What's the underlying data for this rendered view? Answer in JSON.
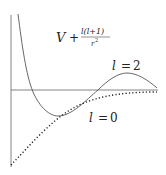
{
  "diagram": {
    "title_formula": {
      "lhs": "V",
      "plus": "+",
      "numerator": "l(l+1)",
      "denominator": "r",
      "denominator_exp": "2"
    },
    "curves": [
      {
        "name": "l = 2",
        "style": "solid",
        "label_var": "l",
        "label_eq": "=",
        "label_val": "2"
      },
      {
        "name": "l = 0",
        "style": "dotted",
        "label_var": "l",
        "label_eq": "=",
        "label_val": "0"
      }
    ],
    "colors": {
      "line": "#555555",
      "axis": "#666666",
      "text": "#222222"
    }
  }
}
